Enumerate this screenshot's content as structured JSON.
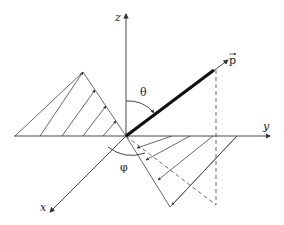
{
  "diagram": {
    "type": "3d-coordinate-system",
    "labels": {
      "x_axis": "x",
      "y_axis": "y",
      "z_axis": "z",
      "vector": "p",
      "polar_angle": "θ",
      "azimuthal_angle": "φ"
    },
    "colors": {
      "lines": "#333333",
      "vector": "#111111",
      "background": "#ffffff"
    }
  }
}
